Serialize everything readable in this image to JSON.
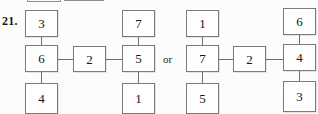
{
  "figure": {
    "problem_number": "21.",
    "separator": "or",
    "box_fill": "#ffffff",
    "box_border": "#7a7a7a",
    "edge_color": "#6f6f6f",
    "text_color": "#131313",
    "page_background": "#fefefe"
  },
  "top_remnants": [
    {
      "name": "remnant-box-left",
      "x": 27,
      "y": -6,
      "w": 34,
      "h": 8
    },
    {
      "name": "remnant-box-right",
      "x": 64,
      "y": -8,
      "w": 40,
      "h": 9
    }
  ],
  "diagrams": [
    {
      "id": "left-diagram",
      "nodes": [
        {
          "id": "L-top-left",
          "label": "3",
          "x": 25,
          "y": 10,
          "w": 33,
          "h": 27
        },
        {
          "id": "L-top-right",
          "label": "7",
          "x": 122,
          "y": 10,
          "w": 33,
          "h": 27
        },
        {
          "id": "L-mid-left",
          "label": "6",
          "x": 25,
          "y": 45,
          "w": 33,
          "h": 27
        },
        {
          "id": "L-mid-center",
          "label": "2",
          "x": 73,
          "y": 46,
          "w": 33,
          "h": 26
        },
        {
          "id": "L-mid-right",
          "label": "5",
          "x": 122,
          "y": 45,
          "w": 33,
          "h": 27
        },
        {
          "id": "L-bottom-left",
          "label": "4",
          "x": 25,
          "y": 83,
          "w": 33,
          "h": 31
        },
        {
          "id": "L-bottom-right",
          "label": "1",
          "x": 122,
          "y": 83,
          "w": 33,
          "h": 31
        }
      ],
      "edges": [
        {
          "id": "L-e1",
          "from": "L-top-left",
          "to": "L-mid-left",
          "orient": "v",
          "x": 41,
          "y": 37,
          "len": 8
        },
        {
          "id": "L-e2",
          "from": "L-top-right",
          "to": "L-mid-right",
          "orient": "v",
          "x": 138,
          "y": 37,
          "len": 8
        },
        {
          "id": "L-e3",
          "from": "L-mid-left",
          "to": "L-mid-center",
          "orient": "h",
          "x": 58,
          "y": 59,
          "len": 15
        },
        {
          "id": "L-e4",
          "from": "L-mid-center",
          "to": "L-mid-right",
          "orient": "h",
          "x": 106,
          "y": 59,
          "len": 16
        },
        {
          "id": "L-e5",
          "from": "L-mid-left",
          "to": "L-bottom-left",
          "orient": "v",
          "x": 41,
          "y": 72,
          "len": 11
        },
        {
          "id": "L-e6",
          "from": "L-mid-right",
          "to": "L-bottom-right",
          "orient": "v",
          "x": 138,
          "y": 72,
          "len": 11
        }
      ]
    },
    {
      "id": "right-diagram",
      "nodes": [
        {
          "id": "R-top-left",
          "label": "1",
          "x": 186,
          "y": 10,
          "w": 33,
          "h": 27
        },
        {
          "id": "R-top-right",
          "label": "6",
          "x": 283,
          "y": 8,
          "w": 33,
          "h": 27
        },
        {
          "id": "R-mid-left",
          "label": "7",
          "x": 186,
          "y": 45,
          "w": 33,
          "h": 27
        },
        {
          "id": "R-mid-center",
          "label": "2",
          "x": 233,
          "y": 46,
          "w": 33,
          "h": 26
        },
        {
          "id": "R-mid-right",
          "label": "4",
          "x": 283,
          "y": 44,
          "w": 33,
          "h": 27
        },
        {
          "id": "R-bottom-left",
          "label": "5",
          "x": 186,
          "y": 83,
          "w": 33,
          "h": 31
        },
        {
          "id": "R-bottom-right",
          "label": "3",
          "x": 283,
          "y": 81,
          "w": 33,
          "h": 31
        }
      ],
      "edges": [
        {
          "id": "R-e1",
          "from": "R-top-left",
          "to": "R-mid-left",
          "orient": "v",
          "x": 202,
          "y": 37,
          "len": 8
        },
        {
          "id": "R-e2",
          "from": "R-top-right",
          "to": "R-mid-right",
          "orient": "v",
          "x": 299,
          "y": 35,
          "len": 9
        },
        {
          "id": "R-e3",
          "from": "R-mid-left",
          "to": "R-mid-center",
          "orient": "h",
          "x": 219,
          "y": 59,
          "len": 14
        },
        {
          "id": "R-e4",
          "from": "R-mid-center",
          "to": "R-mid-right",
          "orient": "h",
          "x": 266,
          "y": 59,
          "len": 17
        },
        {
          "id": "R-e5",
          "from": "R-mid-left",
          "to": "R-bottom-left",
          "orient": "v",
          "x": 202,
          "y": 72,
          "len": 11
        },
        {
          "id": "R-e6",
          "from": "R-mid-right",
          "to": "R-bottom-right",
          "orient": "v",
          "x": 299,
          "y": 71,
          "len": 10
        }
      ]
    }
  ],
  "labels": {
    "problem_number_pos": {
      "x": 2,
      "y": 14
    },
    "or_pos": {
      "x": 163,
      "y": 53
    }
  }
}
